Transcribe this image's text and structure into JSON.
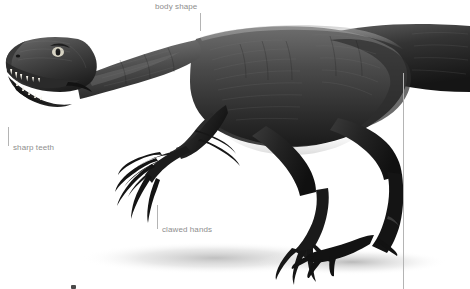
{
  "figure": {
    "background_color": "#ffffff",
    "palette": {
      "skin_dark": "#1e1e1e",
      "skin_mid": "#4a4a4a",
      "skin_light": "#8c8c8c",
      "highlight": "#c8c8c8",
      "shadow": "#cfcfcf",
      "leader_line": "#b4b4b4",
      "label_text": "#8e8e8e"
    }
  },
  "annotations": {
    "body_shape": {
      "label": "body shape",
      "leader": "vertical"
    },
    "sharp_teeth": {
      "label": "sharp teeth",
      "leader": "vertical"
    },
    "clawed_hands": {
      "label": "clawed hands",
      "leader": "vertical"
    },
    "tail_line": {
      "label": "",
      "leader": "vertical"
    }
  }
}
